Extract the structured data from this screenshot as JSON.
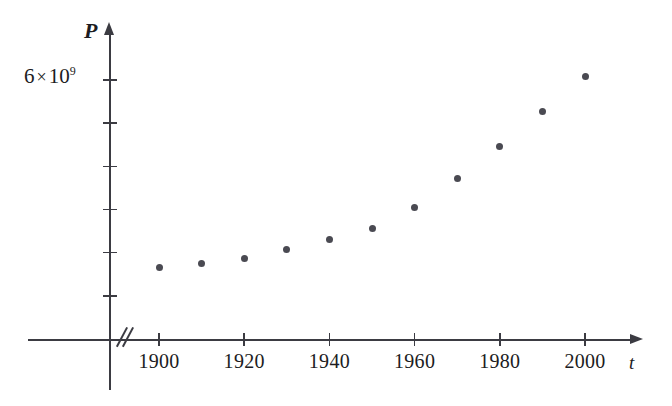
{
  "chart_data": {
    "type": "scatter",
    "title": "",
    "xlabel": "t",
    "ylabel": "P",
    "x": [
      1900,
      1910,
      1920,
      1930,
      1940,
      1950,
      1960,
      1970,
      1980,
      1990,
      2000
    ],
    "values": [
      1650000000.0,
      1750000000.0,
      1860000000.0,
      2070000000.0,
      2300000000.0,
      2560000000.0,
      3040000000.0,
      3710000000.0,
      4450000000.0,
      5280000000.0,
      6080000000.0
    ],
    "series": [
      {
        "name": "P",
        "values": [
          1650000000.0,
          1750000000.0,
          1860000000.0,
          2070000000.0,
          2300000000.0,
          2560000000.0,
          3040000000.0,
          3710000000.0,
          4450000000.0,
          5280000000.0,
          6080000000.0
        ]
      }
    ],
    "points": [
      {
        "x": 1900,
        "y": 1650000000.0
      },
      {
        "x": 1910,
        "y": 1750000000.0
      },
      {
        "x": 1920,
        "y": 1860000000.0
      },
      {
        "x": 1930,
        "y": 2070000000.0
      },
      {
        "x": 1940,
        "y": 2300000000.0
      },
      {
        "x": 1950,
        "y": 2560000000.0
      },
      {
        "x": 1960,
        "y": 3040000000.0
      },
      {
        "x": 1970,
        "y": 3710000000.0
      },
      {
        "x": 1980,
        "y": 4450000000.0
      },
      {
        "x": 1990,
        "y": 5280000000.0
      },
      {
        "x": 2000,
        "y": 6080000000.0
      }
    ],
    "xlim": [
      1895,
      2010
    ],
    "ylim": [
      0,
      6600000000
    ],
    "xticks": [
      1900,
      1920,
      1940,
      1960,
      1980,
      2000
    ],
    "xtick_labels": [
      "1900",
      "1920",
      "1940",
      "1960",
      "1980",
      "2000"
    ],
    "yticks": [
      1000000000,
      2000000000,
      3000000000,
      4000000000,
      5000000000,
      6000000000
    ],
    "ytick_labels": [
      "",
      "",
      "",
      "",
      "",
      "6 × 10⁹"
    ],
    "grid": false,
    "legend": false,
    "legend_position": "none",
    "axis_break_x": true,
    "marker_color": "#4a4a52",
    "axis_color": "#3b3b42",
    "background_color": "#ffffff"
  },
  "axes": {
    "y_label": "P",
    "x_label": "t",
    "y_top_tick_label": {
      "coefficient": "6",
      "times": "×",
      "base": "10",
      "exponent": "9"
    }
  },
  "xticks": [
    {
      "label": "1900"
    },
    {
      "label": "1920"
    },
    {
      "label": "1940"
    },
    {
      "label": "1960"
    },
    {
      "label": "1980"
    },
    {
      "label": "2000"
    }
  ],
  "icons": {
    "y_axis_arrow": "arrow-up-icon",
    "x_axis_arrow": "arrow-right-icon",
    "axis_break": "axis-break-icon"
  }
}
